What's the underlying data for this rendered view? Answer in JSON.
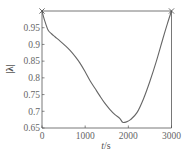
{
  "chart_data": {
    "type": "line",
    "title": "",
    "xlabel": "t/s",
    "ylabel": "|λ|",
    "xlim": [
      0,
      3000
    ],
    "ylim": [
      0.65,
      1.0
    ],
    "xticks": [
      0,
      1000,
      2000,
      3000
    ],
    "xtick_labels": [
      "0",
      "1000",
      "2000",
      "3000"
    ],
    "yticks": [
      0.65,
      0.7,
      0.75,
      0.8,
      0.85,
      0.9,
      0.95
    ],
    "ytick_labels": [
      "0.65",
      "0.7",
      "0.75",
      "0.8",
      "0.85",
      "0.9",
      "0.95"
    ],
    "grid": false,
    "legend": null,
    "series": [
      {
        "name": "|λ|",
        "color": "#666666",
        "x": [
          0,
          60,
          140,
          220,
          300,
          420,
          550,
          650,
          780,
          880,
          1000,
          1110,
          1230,
          1340,
          1450,
          1570,
          1690,
          1800,
          1870,
          1950,
          2050,
          2200,
          2350,
          2500,
          2650,
          2800,
          2900,
          3000
        ],
        "y": [
          1.0,
          0.972,
          0.943,
          0.932,
          0.923,
          0.91,
          0.895,
          0.882,
          0.862,
          0.844,
          0.818,
          0.792,
          0.768,
          0.746,
          0.725,
          0.706,
          0.69,
          0.679,
          0.667,
          0.668,
          0.675,
          0.696,
          0.737,
          0.79,
          0.85,
          0.917,
          0.96,
          1.0
        ]
      }
    ],
    "markers": [
      {
        "x": 0,
        "y": 1.0,
        "symbol": "x"
      },
      {
        "x": 3000,
        "y": 1.0,
        "symbol": "x"
      }
    ],
    "reference_lines": [
      {
        "orientation": "horizontal",
        "y": 1.0,
        "from_x": 0,
        "to_x": 3000
      }
    ]
  }
}
